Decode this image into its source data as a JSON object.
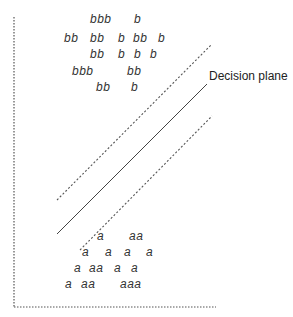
{
  "diagram": {
    "label": "Decision plane",
    "class_b_rows": [
      {
        "y": 23,
        "items": [
          {
            "x": 90,
            "t": "bbb"
          },
          {
            "x": 134,
            "t": "b"
          }
        ]
      },
      {
        "y": 42,
        "items": [
          {
            "x": 64,
            "t": "bb"
          },
          {
            "x": 90,
            "t": "bb"
          },
          {
            "x": 118,
            "t": "b"
          },
          {
            "x": 133,
            "t": "bb"
          },
          {
            "x": 158,
            "t": "b"
          }
        ]
      },
      {
        "y": 58,
        "items": [
          {
            "x": 90,
            "t": "bb"
          },
          {
            "x": 118,
            "t": "b"
          },
          {
            "x": 134,
            "t": "b"
          },
          {
            "x": 150,
            "t": "b"
          }
        ]
      },
      {
        "y": 75,
        "items": [
          {
            "x": 72,
            "t": "bbb"
          },
          {
            "x": 127,
            "t": "bb"
          }
        ]
      },
      {
        "y": 91,
        "items": [
          {
            "x": 96,
            "t": "bb"
          },
          {
            "x": 131,
            "t": "b"
          }
        ]
      }
    ],
    "class_a_rows": [
      {
        "y": 240,
        "items": [
          {
            "x": 97,
            "t": "a"
          },
          {
            "x": 129,
            "t": "aa"
          }
        ]
      },
      {
        "y": 256,
        "items": [
          {
            "x": 82,
            "t": "a"
          },
          {
            "x": 105,
            "t": "a"
          },
          {
            "x": 124,
            "t": "a"
          },
          {
            "x": 146,
            "t": "a"
          }
        ]
      },
      {
        "y": 272,
        "items": [
          {
            "x": 74,
            "t": "a"
          },
          {
            "x": 89,
            "t": "aa"
          },
          {
            "x": 114,
            "t": "a"
          },
          {
            "x": 131,
            "t": "a"
          }
        ]
      },
      {
        "y": 288,
        "items": [
          {
            "x": 65,
            "t": "a"
          },
          {
            "x": 81,
            "t": "aa"
          },
          {
            "x": 120,
            "t": "aaa"
          }
        ]
      }
    ]
  }
}
